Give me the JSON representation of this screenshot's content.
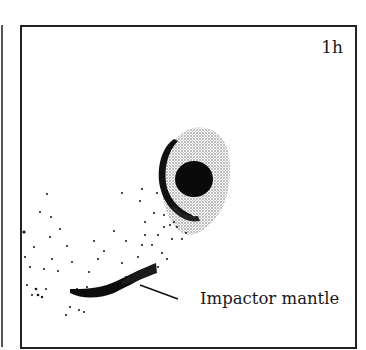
{
  "figure": {
    "time_label": "1h",
    "annotation": "Impactor mantle",
    "colors": {
      "ink": "#111111",
      "stipple": "#555555",
      "frame": "#222222",
      "background": "#ffffff"
    }
  }
}
